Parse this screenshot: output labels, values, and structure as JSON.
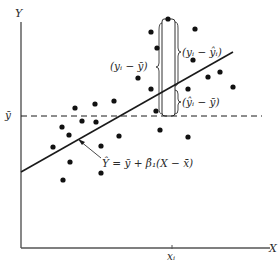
{
  "figure": {
    "axes": {
      "y_label": "Y",
      "x_label": "X",
      "origin": [
        21,
        248
      ],
      "x_end": 270,
      "y_top": 22
    },
    "mean_line": {
      "label": "ȳ",
      "y": 116,
      "x_start": 21,
      "x_end": 262,
      "style": "dashed"
    },
    "regression_line": {
      "x1": 21,
      "y1": 172,
      "x2": 233,
      "y2": 52,
      "equation_label": "Ŷ = ȳ + β̂₁(X − x̄)",
      "pointer": {
        "from": [
          101,
          160
        ],
        "to": [
          78,
          140
        ]
      }
    },
    "xi_tick": {
      "label": "xᵢ",
      "x": 172
    },
    "deviation_brackets": {
      "rail_x": 164,
      "top_y": 19,
      "fit_y": 88,
      "mean_y": 116,
      "total_label": "(yᵢ − ȳ)",
      "unexplained_label": "(yᵢ − ŷᵢ)",
      "explained_label": "(ŷᵢ − ȳ)"
    },
    "data_points": [
      [
        168,
        19
      ],
      [
        151,
        32
      ],
      [
        195,
        29
      ],
      [
        157,
        48
      ],
      [
        193,
        60
      ],
      [
        208,
        77
      ],
      [
        220,
        72
      ],
      [
        233,
        87
      ],
      [
        188,
        89
      ],
      [
        151,
        89
      ],
      [
        138,
        78
      ],
      [
        114,
        101
      ],
      [
        95,
        104
      ],
      [
        75,
        108
      ],
      [
        156,
        111
      ],
      [
        62,
        127
      ],
      [
        82,
        121
      ],
      [
        96,
        122
      ],
      [
        69,
        135
      ],
      [
        119,
        136
      ],
      [
        53,
        147
      ],
      [
        101,
        146
      ],
      [
        160,
        130
      ],
      [
        188,
        137
      ],
      [
        70,
        162
      ],
      [
        101,
        173
      ],
      [
        63,
        180
      ]
    ],
    "colors": {
      "ink": "#1a1a1a",
      "axis": "#555555",
      "background": "#ffffff"
    }
  }
}
